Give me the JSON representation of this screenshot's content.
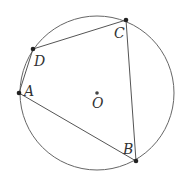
{
  "diagram": {
    "type": "cyclic-quadrilateral",
    "stroke_color": "#555555",
    "point_color": "#222222",
    "circle": {
      "center": "O",
      "cx": 97,
      "cy": 93,
      "r": 77
    },
    "points": {
      "A": {
        "label": "A",
        "x": 19,
        "y": 93
      },
      "B": {
        "label": "B",
        "x": 136,
        "y": 161
      },
      "C": {
        "label": "C",
        "x": 126,
        "y": 20
      },
      "D": {
        "label": "D",
        "x": 33,
        "y": 49
      },
      "O": {
        "label": "O",
        "x": 97,
        "y": 93
      }
    },
    "segments": [
      "AB",
      "BC",
      "CD",
      "DA"
    ],
    "labels": {
      "A": "A",
      "B": "B",
      "C": "C",
      "D": "D",
      "O": "O"
    }
  }
}
